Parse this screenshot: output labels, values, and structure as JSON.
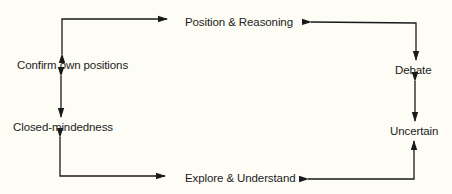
{
  "diagram": {
    "type": "cycle-flow",
    "background": "#fdfdf6",
    "line_color": "#1a1a1a",
    "nodes": {
      "position_reasoning": "Position & Reasoning",
      "confirm_own_positions": "Confirm own positions",
      "closed_mindedness": "Closed-mindedness",
      "explore_understand": "Explore & Understand",
      "debate": "Debate",
      "uncertain": "Uncertain"
    },
    "edges": [
      {
        "from": "confirm_own_positions",
        "to": "position_reasoning",
        "bidirectional": true
      },
      {
        "from": "confirm_own_positions",
        "to": "closed_mindedness",
        "bidirectional": true
      },
      {
        "from": "closed_mindedness",
        "to": "explore_understand",
        "bidirectional": true
      },
      {
        "from": "position_reasoning",
        "to": "debate",
        "bidirectional": true
      },
      {
        "from": "debate",
        "to": "uncertain",
        "bidirectional": true
      },
      {
        "from": "uncertain",
        "to": "explore_understand",
        "bidirectional": true
      }
    ]
  }
}
